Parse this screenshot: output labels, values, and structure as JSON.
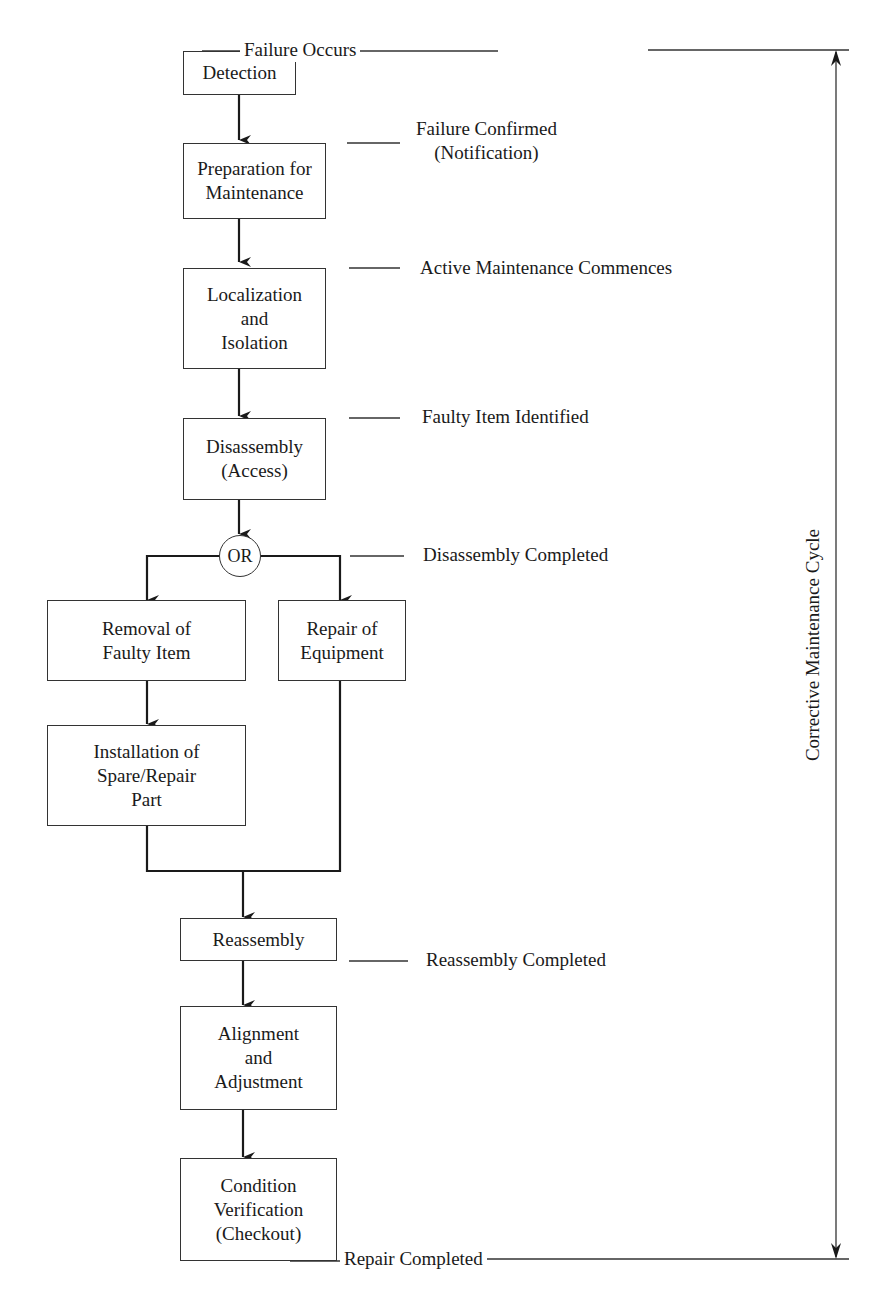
{
  "cycle_label": "Corrective Maintenance Cycle",
  "decision": {
    "label": "OR"
  },
  "steps": [
    {
      "id": "detection",
      "label": "Detection"
    },
    {
      "id": "preparation",
      "label": "Preparation for\nMaintenance"
    },
    {
      "id": "localization",
      "label": "Localization\nand\nIsolation"
    },
    {
      "id": "disassembly",
      "label": "Disassembly\n(Access)"
    },
    {
      "id": "removal",
      "label": "Removal of\nFaulty Item"
    },
    {
      "id": "repair",
      "label": "Repair of\nEquipment"
    },
    {
      "id": "installation",
      "label": "Installation of\nSpare/Repair\nPart"
    },
    {
      "id": "reassembly",
      "label": "Reassembly"
    },
    {
      "id": "alignment",
      "label": "Alignment\nand\nAdjustment"
    },
    {
      "id": "verification",
      "label": "Condition\nVerification\n(Checkout)"
    }
  ],
  "milestones": [
    {
      "label": "Failure Occurs"
    },
    {
      "label": "Failure Confirmed\n(Notification)"
    },
    {
      "label": "Active Maintenance Commences"
    },
    {
      "label": "Faulty Item Identified"
    },
    {
      "label": "Disassembly Completed"
    },
    {
      "label": "Reassembly Completed"
    },
    {
      "label": "Repair Completed"
    }
  ]
}
